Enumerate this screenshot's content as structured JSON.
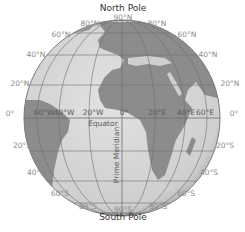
{
  "diagram": {
    "type": "globe-latitude-longitude",
    "top_label": "North Pole",
    "bottom_label": "South Pole",
    "equator_label": "Equator",
    "prime_meridian_label": "Prime Meridian",
    "latitude_labels": {
      "n90": "90°N",
      "n80_left": "80°N",
      "n80_right": "80°N",
      "n60_left": "60°N",
      "n60_right": "60°N",
      "n40_left": "40°N",
      "n40_right": "40°N",
      "n20_left": "20°N",
      "n20_right": "20°N",
      "zero_left": "0°",
      "zero_right": "0°",
      "s20_left": "20°S",
      "s20_right": "20°S",
      "s40_left": "40°S",
      "s40_right": "40°S",
      "s60_left": "60°S",
      "s60_right": "60°S",
      "s80_left": "80°S",
      "s80_right": "80°S",
      "s90": "90°S"
    },
    "longitude_labels": {
      "w60": "60°W",
      "w40": "40°W",
      "w20": "20°W",
      "zero": "0°",
      "e20": "20°E",
      "e40": "40°E",
      "e60": "60°E"
    },
    "colors": {
      "ocean": "#d6d6d6",
      "land": "#8c8c8c",
      "grid": "#6e6e6e",
      "rim": "#7a7a7a",
      "label": "#8a8a8a"
    }
  }
}
